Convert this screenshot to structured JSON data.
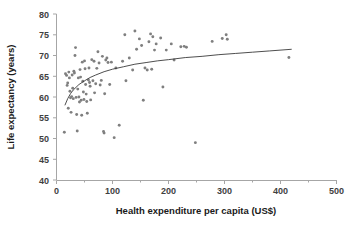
{
  "chart_data": {
    "type": "scatter",
    "title": "",
    "xlabel": "Health expenditure per capita (US$)",
    "ylabel": "Life expectancy (years)",
    "xlim": [
      0,
      500
    ],
    "ylim": [
      40,
      80
    ],
    "xticks": [
      0,
      100,
      200,
      300,
      400,
      500
    ],
    "yticks": [
      40,
      45,
      50,
      55,
      60,
      65,
      70,
      75,
      80
    ],
    "xtick_labels": [
      "0",
      "100",
      "200",
      "300",
      "400",
      "500"
    ],
    "ytick_labels": [
      "40",
      "45",
      "50",
      "55",
      "60",
      "65",
      "70",
      "75",
      "80"
    ],
    "grid": false,
    "legend": null,
    "marker_color": "#7f7f7f",
    "trendline_color": "#3a3a3a",
    "axis_color": "#a6a6a6",
    "series": [
      {
        "name": "Countries",
        "marker": "circle",
        "points": [
          [
            14,
            51.5
          ],
          [
            16,
            65.6
          ],
          [
            18,
            65.2
          ],
          [
            19,
            62.8
          ],
          [
            20,
            63.4
          ],
          [
            21,
            57.3
          ],
          [
            22,
            66.0
          ],
          [
            23,
            64.6
          ],
          [
            24,
            61.4
          ],
          [
            25,
            59.8
          ],
          [
            26,
            56.3
          ],
          [
            27,
            60.1
          ],
          [
            28,
            65.3
          ],
          [
            29,
            62.1
          ],
          [
            30,
            59.6
          ],
          [
            31,
            66.2
          ],
          [
            32,
            65.8
          ],
          [
            33,
            70.0
          ],
          [
            34,
            71.9
          ],
          [
            35,
            59.9
          ],
          [
            36,
            55.8
          ],
          [
            37,
            51.8
          ],
          [
            38,
            61.9
          ],
          [
            39,
            64.6
          ],
          [
            40,
            60.0
          ],
          [
            41,
            58.8
          ],
          [
            42,
            66.6
          ],
          [
            43,
            64.8
          ],
          [
            44,
            59.2
          ],
          [
            45,
            55.6
          ],
          [
            46,
            68.4
          ],
          [
            47,
            63.8
          ],
          [
            48,
            61.2
          ],
          [
            49,
            59.4
          ],
          [
            50,
            68.7
          ],
          [
            51,
            66.8
          ],
          [
            52,
            63.0
          ],
          [
            53,
            60.7
          ],
          [
            54,
            58.9
          ],
          [
            55,
            56.1
          ],
          [
            57,
            64.1
          ],
          [
            58,
            67.0
          ],
          [
            59,
            63.5
          ],
          [
            60,
            62.6
          ],
          [
            61,
            59.3
          ],
          [
            63,
            69.0
          ],
          [
            65,
            63.9
          ],
          [
            67,
            68.6
          ],
          [
            68,
            61.0
          ],
          [
            70,
            63.2
          ],
          [
            72,
            66.9
          ],
          [
            74,
            70.9
          ],
          [
            76,
            68.2
          ],
          [
            78,
            62.9
          ],
          [
            80,
            64.0
          ],
          [
            82,
            69.8
          ],
          [
            84,
            51.7
          ],
          [
            85,
            51.3
          ],
          [
            86,
            60.8
          ],
          [
            88,
            68.9
          ],
          [
            90,
            69.4
          ],
          [
            92,
            68.3
          ],
          [
            95,
            63.0
          ],
          [
            98,
            68.4
          ],
          [
            103,
            50.2
          ],
          [
            106,
            67.0
          ],
          [
            112,
            53.2
          ],
          [
            118,
            68.6
          ],
          [
            122,
            75.0
          ],
          [
            124,
            63.9
          ],
          [
            130,
            69.4
          ],
          [
            136,
            66.5
          ],
          [
            140,
            75.9
          ],
          [
            143,
            71.5
          ],
          [
            148,
            74.0
          ],
          [
            152,
            72.4
          ],
          [
            155,
            59.2
          ],
          [
            158,
            67.0
          ],
          [
            162,
            66.5
          ],
          [
            165,
            73.3
          ],
          [
            168,
            75.2
          ],
          [
            170,
            66.7
          ],
          [
            172,
            74.5
          ],
          [
            175,
            71.3
          ],
          [
            178,
            72.8
          ],
          [
            186,
            74.2
          ],
          [
            190,
            62.4
          ],
          [
            196,
            71.3
          ],
          [
            205,
            72.8
          ],
          [
            210,
            68.9
          ],
          [
            222,
            72.1
          ],
          [
            228,
            72.2
          ],
          [
            232,
            72.0
          ],
          [
            248,
            49.0
          ],
          [
            278,
            73.4
          ],
          [
            296,
            74.1
          ],
          [
            303,
            75.0
          ],
          [
            305,
            73.9
          ],
          [
            415,
            69.5
          ]
        ]
      }
    ],
    "trendline": {
      "type": "logarithmic",
      "points": [
        [
          15,
          58.0
        ],
        [
          20,
          59.6
        ],
        [
          25,
          60.8
        ],
        [
          30,
          61.7
        ],
        [
          40,
          63.0
        ],
        [
          50,
          63.9
        ],
        [
          60,
          64.7
        ],
        [
          70,
          65.3
        ],
        [
          85,
          66.1
        ],
        [
          100,
          66.7
        ],
        [
          120,
          67.3
        ],
        [
          140,
          67.9
        ],
        [
          160,
          68.3
        ],
        [
          180,
          68.7
        ],
        [
          200,
          69.0
        ],
        [
          230,
          69.5
        ],
        [
          260,
          69.8
        ],
        [
          290,
          70.2
        ],
        [
          320,
          70.5
        ],
        [
          350,
          70.8
        ],
        [
          380,
          71.1
        ],
        [
          420,
          71.5
        ]
      ]
    }
  }
}
